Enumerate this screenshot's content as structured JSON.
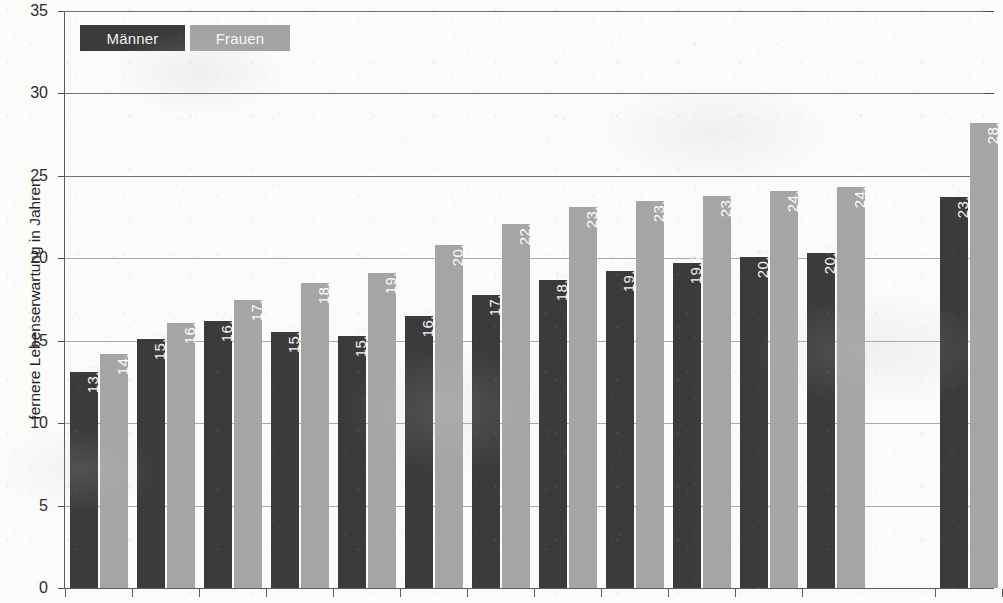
{
  "chart_data": {
    "type": "bar",
    "title": "",
    "xlabel": "",
    "ylabel": "fernere Lebenserwartung in Jahren",
    "ylim": [
      0,
      35
    ],
    "yticks": [
      0,
      5,
      10,
      15,
      20,
      25,
      30,
      35
    ],
    "ytick_labels": [
      "0",
      "5",
      "10",
      "15",
      "20",
      "25",
      "30",
      "35"
    ],
    "grid": true,
    "legend_position": "top-left",
    "categories": [
      "",
      "",
      "",
      "",
      "",
      "",
      "",
      "",
      "",
      "",
      "",
      "",
      ""
    ],
    "series": [
      {
        "name": "Männer",
        "color": "#3b3b3b",
        "values": [
          13.1,
          15.1,
          16.2,
          15.5,
          15.3,
          16.5,
          17.8,
          18.7,
          19.2,
          19.7,
          20.1,
          20.3,
          23.7
        ],
        "labels": [
          "13,1",
          "15,1",
          "16,2",
          "15,5",
          "15,3",
          "16,5",
          "17,8",
          "18,7",
          "19,2",
          "19,7",
          "20,1",
          "20,3",
          "23,7"
        ]
      },
      {
        "name": "Frauen",
        "color": "#a5a5a5",
        "values": [
          14.2,
          16.1,
          17.5,
          18.5,
          19.1,
          20.8,
          22.1,
          23.1,
          23.5,
          23.8,
          24.1,
          24.3,
          28.2
        ],
        "labels": [
          "14,2",
          "16,1",
          "17,5",
          "18,5",
          "19,1",
          "20,8",
          "22,1",
          "23,1",
          "23,5",
          "23,8",
          "24,1",
          "24,3",
          "28,2"
        ]
      }
    ],
    "group_gap_before_last": true
  },
  "legend": {
    "men_label": "Männer",
    "women_label": "Frauen"
  },
  "axis": {
    "y_title": "fernere Lebenserwartung in Jahren"
  }
}
